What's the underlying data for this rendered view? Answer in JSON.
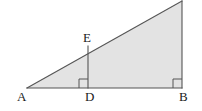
{
  "figure": {
    "canvas": {
      "width": 202,
      "height": 111,
      "background": "#ffffff"
    },
    "style": {
      "fill": "#e3e3e3",
      "stroke": "#555555",
      "stroke_width": 1.1,
      "label_color": "#1a1a1a"
    },
    "points": {
      "A": {
        "x": 27,
        "y": 88
      },
      "B": {
        "x": 182,
        "y": 88
      },
      "C": {
        "x": 182,
        "y": 1
      },
      "D": {
        "x": 88,
        "y": 88
      },
      "E": {
        "x": 88,
        "y": 46
      }
    },
    "labels": {
      "A": "A",
      "D": "D",
      "B": "B",
      "E": "E"
    },
    "segments": [
      {
        "name": "AB",
        "from": "A",
        "to": "B"
      },
      {
        "name": "BC",
        "from": "B",
        "to": "C"
      },
      {
        "name": "CA",
        "from": "C",
        "to": "A"
      },
      {
        "name": "DE",
        "from": "D",
        "to": "E"
      }
    ],
    "right_angles": [
      {
        "name": "angle-at-D",
        "vertex": "D",
        "size": 9
      },
      {
        "name": "angle-at-B",
        "vertex": "B",
        "size": 9
      }
    ]
  }
}
